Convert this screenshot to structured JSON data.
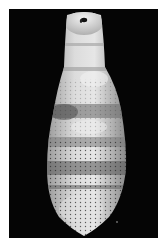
{
  "image": {
    "description": "Photograph of an elongated, segmented, speckled pale specimen (fossil-like) on a black background",
    "alt": "Segmented elongated specimen on black background"
  },
  "colors": {
    "page_background": "#ffffff",
    "photo_background": "#050505",
    "specimen_light": "#e8e8e8",
    "specimen_mid": "#b5b5b5",
    "specimen_dark": "#6a6a6a",
    "speckle": "#2a2a2a"
  }
}
